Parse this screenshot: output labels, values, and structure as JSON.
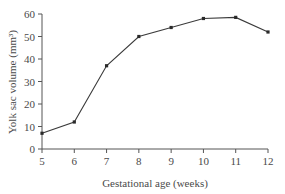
{
  "chart_data": {
    "type": "line",
    "title": "",
    "xlabel": "Gestational age (weeks)",
    "ylabel": "Yolk sac volume (mm³)",
    "x": [
      5,
      6,
      7,
      8,
      9,
      10,
      11,
      12
    ],
    "series": [
      {
        "name": "Yolk sac volume",
        "values": [
          7,
          12,
          37,
          50,
          54,
          58,
          58.5,
          52
        ]
      }
    ],
    "xlim": [
      5,
      12
    ],
    "ylim": [
      0,
      60
    ],
    "xticks": [
      "5",
      "6",
      "7",
      "8",
      "9",
      "10",
      "11",
      "12"
    ],
    "yticks": [
      "0",
      "10",
      "20",
      "30",
      "40",
      "50",
      "60"
    ],
    "grid": false,
    "legend": null,
    "colors": {
      "line": "#3a3a3a",
      "marker": "#2a2a2a",
      "axis": "#555555"
    }
  }
}
